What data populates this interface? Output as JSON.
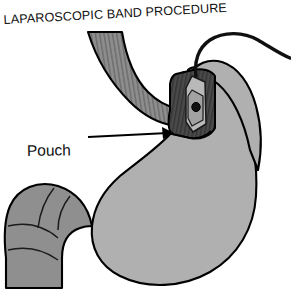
{
  "figure": {
    "title": "LAPAROSCOPIC BAND PROCEDURE",
    "width": 291,
    "height": 292,
    "background_color": "#ffffff",
    "outline_color": "#000000"
  },
  "labels": {
    "pouch": "Pouch"
  },
  "annotations": {
    "pouch_leader": {
      "kind": "arrow",
      "direction": "right",
      "from_x": 88,
      "from_y": 137,
      "to_x": 173,
      "to_y": 133
    }
  },
  "parts": {
    "esophagus": {
      "name": "esophagus",
      "fill_color": "#8d8d8d",
      "texture": "vertical-striations",
      "stroke_color": "#000000"
    },
    "pouch": {
      "name": "gastric-pouch",
      "fill_color": "#a9a9a9",
      "stroke_color": "#000000"
    },
    "band": {
      "name": "adjustable-gastric-band",
      "fill_color": "#4a4a4a",
      "stroke_color": "#000000",
      "buckle_fill_color": "#b9b9b9",
      "buckle_port_color": "#111111"
    },
    "tubing": {
      "name": "band-tubing",
      "stroke_color": "#101010",
      "stroke_width": 3.4
    },
    "stomach_body": {
      "name": "stomach-body",
      "fill_color": "#b0b0b0",
      "stroke_color": "#000000"
    },
    "duodenum": {
      "name": "duodenum",
      "fill_color": "#8f8f8f",
      "stroke_color": "#000000",
      "fold_lines": 4
    }
  }
}
